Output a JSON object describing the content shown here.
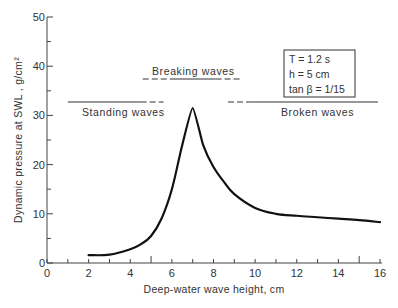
{
  "chart_data": {
    "type": "line",
    "title": "",
    "xlabel": "Deep-water wave height, cm",
    "ylabel": "Dynamic pressure at SWL , g/cm²",
    "xlim": [
      0,
      16
    ],
    "ylim": [
      0,
      50
    ],
    "x_ticks": [
      "0",
      "2",
      "4",
      "6",
      "8",
      "10",
      "12",
      "14",
      "16"
    ],
    "y_ticks": [
      "0",
      "10",
      "20",
      "30",
      "40",
      "50"
    ],
    "grid": false,
    "series": [
      {
        "name": "Dynamic pressure",
        "x": [
          2,
          3,
          4,
          4.5,
          5,
          5.5,
          6,
          6.5,
          7,
          7.5,
          8,
          8.5,
          9,
          10,
          11,
          12,
          13,
          14,
          15,
          16
        ],
        "y": [
          1.6,
          1.7,
          2.8,
          3.8,
          5.5,
          9,
          15,
          24,
          31.5,
          24,
          19.5,
          16.5,
          14,
          11.2,
          10,
          9.6,
          9.3,
          9,
          8.7,
          8.3
        ]
      }
    ],
    "regions": [
      {
        "label": "Standing waves",
        "solid": [
          1,
          4.5
        ],
        "dashed": [
          4.5,
          5.6
        ]
      },
      {
        "label": "Breaking waves",
        "dashed_left": [
          4.6,
          6.0
        ],
        "solid": [
          6.0,
          8.1
        ],
        "dashed_right": [
          8.1,
          9.3
        ]
      },
      {
        "label": "Broken waves",
        "dashed": [
          8.7,
          9.7
        ],
        "solid": [
          9.7,
          15.9
        ]
      }
    ],
    "annotations": {
      "params": [
        "T = 1.2 s",
        "h = 5 cm",
        "tan β = 1/15"
      ]
    }
  },
  "labels": {
    "xlabel": "Deep-water wave height, cm",
    "ylabel": "Dynamic pressure at SWL , g/cm²",
    "standing": "Standing waves",
    "breaking": "Breaking waves",
    "broken": "Broken waves",
    "param_T": "T = 1.2 s",
    "param_h": "h = 5 cm",
    "param_tan": "tan β = 1/15"
  }
}
